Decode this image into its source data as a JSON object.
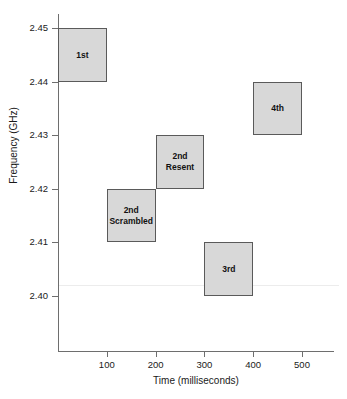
{
  "chart_data": {
    "type": "bar",
    "title": "",
    "xlabel": "Time (milliseconds)",
    "ylabel": "Frequency (GHz)",
    "xlim": [
      0,
      560
    ],
    "ylim": [
      2.3935,
      2.4525
    ],
    "xticks": [
      100,
      200,
      300,
      400,
      500
    ],
    "xtick_labels": [
      "100",
      "200",
      "300",
      "400",
      "500"
    ],
    "yticks": [
      2.45,
      2.44,
      2.43,
      2.42,
      2.41,
      2.4
    ],
    "ytick_labels": [
      "2.45",
      "2.44",
      "2.43",
      "2.42",
      "2.41",
      "2.40"
    ],
    "grid": false,
    "legend": "none",
    "box_fill_color": "#d8d8d8",
    "box_border_color": "#5a5a5a",
    "reference_line": {
      "orientation": "horizontal",
      "y": 2.402,
      "color": "#ececec"
    },
    "boxes": [
      {
        "label": "1st",
        "x_start": 0,
        "x_end": 100,
        "y_start": 2.44,
        "y_end": 2.45
      },
      {
        "label": "2nd\nScrambled",
        "x_start": 100,
        "x_end": 200,
        "y_start": 2.41,
        "y_end": 2.42
      },
      {
        "label": "2nd\nResent",
        "x_start": 200,
        "x_end": 300,
        "y_start": 2.42,
        "y_end": 2.43
      },
      {
        "label": "3rd",
        "x_start": 300,
        "x_end": 400,
        "y_start": 2.4,
        "y_end": 2.41
      },
      {
        "label": "4th",
        "x_start": 400,
        "x_end": 500,
        "y_start": 2.43,
        "y_end": 2.44
      }
    ]
  }
}
